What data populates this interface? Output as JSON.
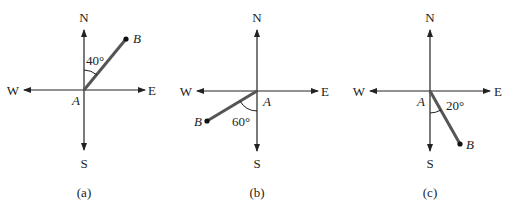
{
  "figure": {
    "panels": [
      {
        "id": "a",
        "caption": "(a)",
        "compass": {
          "north": "N",
          "south": "S",
          "east": "E",
          "west": "W"
        },
        "origin_label": "A",
        "endpoint_label": "B",
        "angle_label": "40°",
        "angle_deg": 40,
        "reference": "N",
        "direction": "N40°E"
      },
      {
        "id": "b",
        "caption": "(b)",
        "compass": {
          "north": "N",
          "south": "S",
          "east": "E",
          "west": "W"
        },
        "origin_label": "A",
        "endpoint_label": "B",
        "angle_label": "60°",
        "angle_deg": 60,
        "reference": "S",
        "direction": "S60°W"
      },
      {
        "id": "c",
        "caption": "(c)",
        "compass": {
          "north": "N",
          "south": "S",
          "east": "E",
          "west": "W"
        },
        "origin_label": "A",
        "endpoint_label": "B",
        "angle_label": "20°",
        "angle_deg": 20,
        "reference": "S",
        "direction": "S20°E"
      }
    ],
    "colors": {
      "axis": "#222222",
      "segment": "#555555",
      "text": "#222222"
    }
  }
}
